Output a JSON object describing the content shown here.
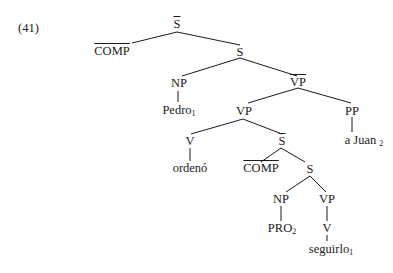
{
  "example_number": "(41)",
  "nodes": {
    "root_sbar": "S",
    "comp_top": "COMP",
    "s_top": "S",
    "np_subject": "NP",
    "vbar_top": "VP",
    "pedro": "Pedro",
    "pedro_index": "1",
    "vp_mid": "VP",
    "pp": "PP",
    "v_main": "V",
    "sbar_inner": "S",
    "a_juan": "a Juan",
    "a_juan_index": "2",
    "ordeno": "ordenó",
    "comp_inner": "COMP",
    "s_inner": "S",
    "np_inner": "NP",
    "vp_inner": "VP",
    "pro": "PRO",
    "pro_index": "2",
    "v_inner": "V",
    "seguirlo": "seguirlo",
    "seguirlo_index": "1"
  },
  "colors": {
    "ink": "#1a1a1a",
    "background": "#ffffff"
  }
}
